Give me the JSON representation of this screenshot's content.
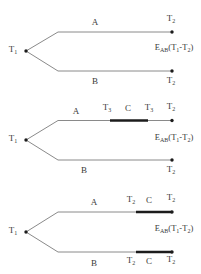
{
  "colors": {
    "background": "#ffffff",
    "thin_line": "#8a8a8a",
    "thick_segment": "#1c1c1c",
    "text": "#3a3a3a"
  },
  "panels": [
    {
      "source": {
        "base": "T",
        "sub": "1"
      },
      "path_a_label": "A",
      "path_b_label": "B",
      "detector_a": {
        "base": "T",
        "sub": "2"
      },
      "detector_b": {
        "base": "T",
        "sub": "2"
      },
      "correlation": {
        "e": "E",
        "e_sub": "AB",
        "open": "(T",
        "sub1": "1",
        "sep": "-T",
        "sub2": "2",
        "close": ")"
      }
    },
    {
      "source": {
        "base": "T",
        "sub": "1"
      },
      "path_a_label": "A",
      "path_b_label": "B",
      "clock_start": {
        "base": "T",
        "sub": "3"
      },
      "clock_label": "C",
      "clock_end": {
        "base": "T",
        "sub": "3"
      },
      "detector_a": {
        "base": "T",
        "sub": "2"
      },
      "detector_b": {
        "base": "T",
        "sub": "2"
      },
      "correlation": {
        "e": "E",
        "e_sub": "AB",
        "open": "(T",
        "sub1": "1",
        "sep": "-T",
        "sub2": "2",
        "close": ")"
      }
    },
    {
      "source": {
        "base": "T",
        "sub": "1"
      },
      "path_a_label": "A",
      "path_b_label": "B",
      "clock_a_start": {
        "base": "T",
        "sub": "2"
      },
      "clock_a_label": "C",
      "detector_a": {
        "base": "T",
        "sub": "2"
      },
      "clock_b_start": {
        "base": "T",
        "sub": "2"
      },
      "clock_b_label": "C",
      "detector_b": {
        "base": "T",
        "sub": "2"
      },
      "correlation": {
        "e": "E",
        "e_sub": "AB",
        "open": "(T",
        "sub1": "1",
        "sep": "-T",
        "sub2": "2",
        "close": ")"
      }
    }
  ]
}
